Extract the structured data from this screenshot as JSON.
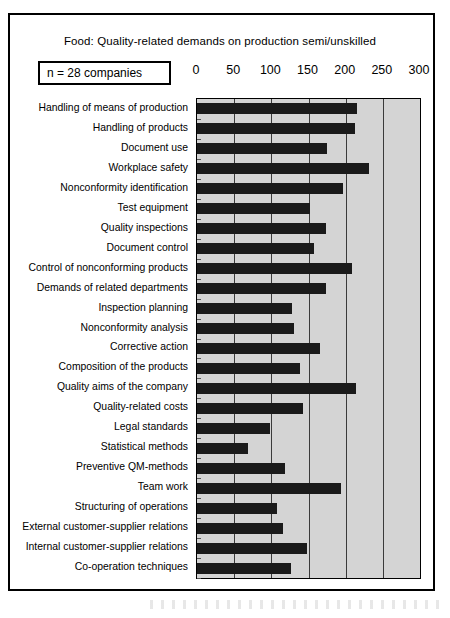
{
  "chart_data": {
    "type": "bar",
    "orientation": "horizontal",
    "title": "Food:  Quality-related demands on production semi/unskilled",
    "annotation": "n = 28 companies",
    "xlabel": "",
    "ylabel": "",
    "xlim": [
      0,
      300
    ],
    "xticks": [
      0,
      50,
      100,
      150,
      200,
      250,
      300
    ],
    "xtick_labels": [
      "0",
      "50",
      "100",
      "150",
      "200",
      "250",
      "300"
    ],
    "grid": true,
    "legend": false,
    "bar_color": "#1a1a1a",
    "plot_background": "#d4d4d4",
    "categories": [
      "Handling of means of production",
      "Handling of products",
      "Document use",
      "Workplace safety",
      "Nonconformity identification",
      "Test equipment",
      "Quality inspections",
      "Document control",
      "Control of nonconforming products",
      "Demands of related departments",
      "Inspection planning",
      "Nonconformity analysis",
      "Corrective action",
      "Composition of the  products",
      "Quality aims of the company",
      "Quality-related costs",
      "Legal standards",
      "Statistical methods",
      "Preventive QM-methods",
      "Team work",
      "Structuring of operations",
      "External customer-supplier relations",
      "Internal customer-supplier relations",
      "Co-operation techniques"
    ],
    "values": [
      215,
      213,
      175,
      232,
      196,
      152,
      173,
      157,
      209,
      173,
      128,
      131,
      166,
      139,
      214,
      143,
      98,
      68,
      119,
      194,
      107,
      116,
      148,
      126
    ]
  }
}
